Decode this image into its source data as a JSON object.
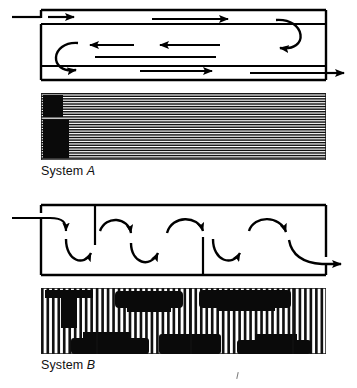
{
  "figure": {
    "type": "flow-visualization-comparison",
    "line_color": "#000000",
    "background_color": "#ffffff"
  },
  "panels": [
    {
      "id": "system-a",
      "label": "System ",
      "label_id": "A",
      "diagram": {
        "name": "system-a-flow-schematic",
        "vessel": {
          "x": 41,
          "y": 10,
          "width": 285,
          "height": 70
        },
        "inlet": {
          "side": "left",
          "position": "top",
          "direction": "right"
        },
        "outlet": {
          "side": "right",
          "position": "bottom",
          "direction": "right"
        },
        "flow_pattern": "horizontal-serpentine-longitudinal",
        "internal_baffles": 0,
        "straight_arrows": 6,
        "u_turns": 2
      },
      "photo": {
        "name": "system-a-streak-photograph",
        "texture": "horizontal-striations",
        "stripe_orientation": "horizontal",
        "stripe_count": 26,
        "dark_region": "left-edge",
        "note": "long axial streamlines indicating laminar longitudinal flow"
      }
    },
    {
      "id": "system-b",
      "label": "System ",
      "label_id": "B",
      "diagram": {
        "name": "system-b-flow-schematic",
        "vessel": {
          "x": 41,
          "y": 205,
          "width": 285,
          "height": 70
        },
        "inlet": {
          "side": "left",
          "position": "top",
          "direction": "right"
        },
        "outlet": {
          "side": "right",
          "position": "bottom",
          "direction": "right"
        },
        "flow_pattern": "vertical-serpentine-crossflow",
        "internal_baffles": 2,
        "baffles": [
          {
            "from": "top",
            "x": 95
          },
          {
            "from": "bottom",
            "x": 203
          }
        ],
        "down_arrows": 4,
        "up_arrows": 3,
        "u_turns": 7
      },
      "photo": {
        "name": "system-b-streak-photograph",
        "texture": "vertical-striations-with-dark-blobs",
        "stripe_orientation": "vertical",
        "stripe_count": 52,
        "dark_regions": "alternating top and bottom blobs",
        "note": "transverse streamlines indicating cross-flow mixing cells"
      }
    }
  ]
}
